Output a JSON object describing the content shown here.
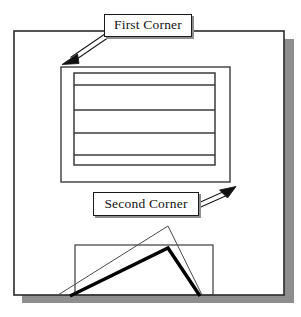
{
  "figure": {
    "callouts": [
      {
        "id": "first-corner",
        "label": "First Corner"
      },
      {
        "id": "second-corner",
        "label": "Second Corner"
      }
    ],
    "colors": {
      "ink": "#1a1a1a",
      "thin_line": "#3b3b3b",
      "thick_line": "#000000",
      "shadow": "#8e8e8e",
      "paper": "#ffffff"
    },
    "shapes": {
      "outer_frame": {
        "x": 14,
        "y": 31,
        "width": 270,
        "height": 264
      },
      "outer_frame_shadow_offset": 8,
      "middle_rect": {
        "x": 61,
        "y": 67,
        "width": 169,
        "height": 115
      },
      "inner_rect": {
        "x": 74,
        "y": 73,
        "width": 141,
        "height": 92
      },
      "inner_divider_lines_y": [
        85,
        110,
        133,
        155
      ],
      "bottom_rect": {
        "x": 75,
        "y": 245,
        "width": 138,
        "height": 50
      },
      "thin_triangle": [
        [
          58,
          295
        ],
        [
          168,
          226
        ],
        [
          202,
          295
        ]
      ],
      "thick_chevron": [
        [
          70,
          296
        ],
        [
          168,
          248
        ],
        [
          200,
          296
        ]
      ]
    },
    "arrows": [
      {
        "id": "first-corner-arrow",
        "from": [
          110,
          33
        ],
        "to": [
          63,
          64
        ],
        "direction": "down-left",
        "points_to": "top-left corner of middle rectangle"
      },
      {
        "id": "second-corner-arrow",
        "from": [
          196,
          207
        ],
        "to": [
          234,
          188
        ],
        "direction": "up-right",
        "points_to": "bottom-right corner of middle rectangle"
      }
    ]
  }
}
